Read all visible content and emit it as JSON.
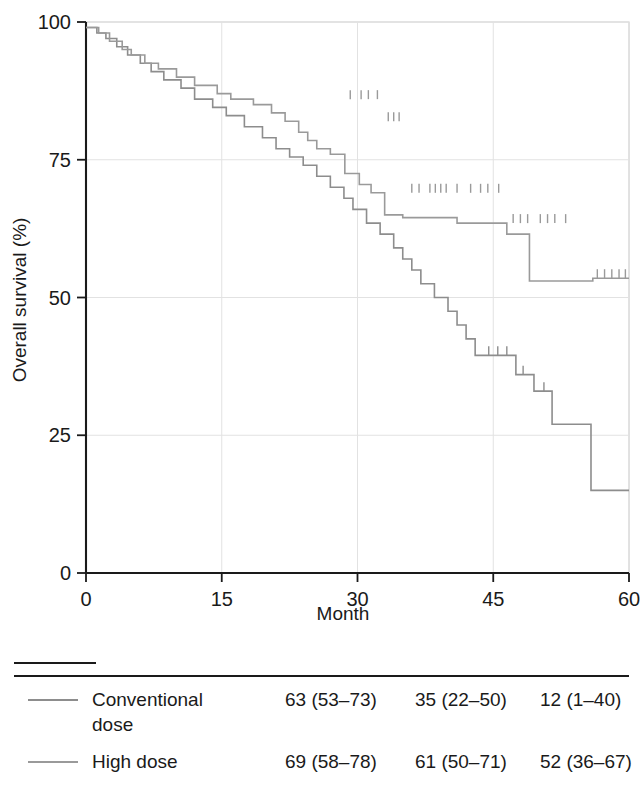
{
  "figure": {
    "type": "kaplan-meier-survival-plot"
  },
  "axes": {
    "y_title": "Overall survival (%)",
    "x_title": "Month",
    "y_ticks": [
      "0",
      "25",
      "50",
      "75",
      "100"
    ],
    "x_ticks": [
      "0",
      "15",
      "30",
      "45",
      "60"
    ]
  },
  "key": {
    "heading": "KEY",
    "rows": [
      {
        "label_line1": "Conventional",
        "label_line2": "dose",
        "col1": "63 (53–73)",
        "col2": "35 (22–50)",
        "col3": "12 (1–40)",
        "color": "#8d8d8d"
      },
      {
        "label_line1": "High dose",
        "label_line2": "",
        "col1": "69 (58–78)",
        "col2": "61 (50–71)",
        "col3": "52 (36–67)",
        "color": "#9a9a9a"
      }
    ]
  },
  "chart_data": {
    "type": "line",
    "title": "",
    "xlabel": "Month",
    "ylabel": "Overall survival (%)",
    "xlim": [
      0,
      60
    ],
    "ylim": [
      0,
      100
    ],
    "xticks": [
      0,
      15,
      30,
      45,
      60
    ],
    "yticks": [
      0,
      25,
      50,
      75,
      100
    ],
    "grid": true,
    "legend_position": "below-plot",
    "step_type": "post",
    "series": [
      {
        "name": "Conventional dose",
        "color": "#8d8d8d",
        "survival_at_12_months": 63,
        "survival_at_36_months": 35,
        "survival_at_60_months": 12,
        "points": [
          [
            0,
            99
          ],
          [
            1.2,
            99
          ],
          [
            1.2,
            98
          ],
          [
            2.2,
            98
          ],
          [
            2.2,
            97
          ],
          [
            3.4,
            97
          ],
          [
            3.4,
            95.5
          ],
          [
            4.6,
            95.5
          ],
          [
            4.6,
            94
          ],
          [
            6.0,
            94
          ],
          [
            6.0,
            92.5
          ],
          [
            7.2,
            92.5
          ],
          [
            7.2,
            91
          ],
          [
            8.6,
            91
          ],
          [
            8.6,
            89.5
          ],
          [
            10.5,
            89.5
          ],
          [
            10.5,
            88
          ],
          [
            12.0,
            88
          ],
          [
            12.0,
            86
          ],
          [
            14.0,
            86
          ],
          [
            14.0,
            84.5
          ],
          [
            15.5,
            84.5
          ],
          [
            15.5,
            83
          ],
          [
            17.5,
            83
          ],
          [
            17.5,
            81
          ],
          [
            19.5,
            81
          ],
          [
            19.5,
            79
          ],
          [
            21.0,
            79
          ],
          [
            21.0,
            77
          ],
          [
            22.5,
            77
          ],
          [
            22.5,
            75.5
          ],
          [
            24.0,
            75.5
          ],
          [
            24.0,
            74
          ],
          [
            25.5,
            74
          ],
          [
            25.5,
            72
          ],
          [
            27.0,
            72
          ],
          [
            27.0,
            70
          ],
          [
            28.5,
            70
          ],
          [
            28.5,
            68
          ],
          [
            29.5,
            68
          ],
          [
            29.5,
            66
          ],
          [
            31.0,
            66
          ],
          [
            31.0,
            63.5
          ],
          [
            32.5,
            63.5
          ],
          [
            32.5,
            61.5
          ],
          [
            34.0,
            61.5
          ],
          [
            34.0,
            59
          ],
          [
            35.0,
            59
          ],
          [
            35.0,
            57
          ],
          [
            36.0,
            57
          ],
          [
            36.0,
            55
          ],
          [
            37.0,
            55
          ],
          [
            37.0,
            52.5
          ],
          [
            38.5,
            52.5
          ],
          [
            38.5,
            50
          ],
          [
            40.0,
            50
          ],
          [
            40.0,
            47.5
          ],
          [
            41.0,
            47.5
          ],
          [
            41.0,
            45
          ],
          [
            42.0,
            45
          ],
          [
            42.0,
            42.5
          ],
          [
            43.0,
            42.5
          ],
          [
            43.0,
            39.5
          ],
          [
            47.5,
            39.5
          ],
          [
            47.5,
            36
          ],
          [
            49.5,
            36
          ],
          [
            49.5,
            33
          ],
          [
            51.5,
            33
          ],
          [
            51.5,
            27
          ],
          [
            55.8,
            27
          ],
          [
            55.8,
            15
          ],
          [
            60,
            15
          ]
        ],
        "censor_marks": [
          [
            44.5,
            39.5
          ],
          [
            45.5,
            39.5
          ],
          [
            46.5,
            39.5
          ],
          [
            48.3,
            36
          ],
          [
            50.6,
            33
          ]
        ]
      },
      {
        "name": "High dose",
        "color": "#9a9a9a",
        "survival_at_12_months": 69,
        "survival_at_36_months": 61,
        "survival_at_60_months": 52,
        "points": [
          [
            0,
            99
          ],
          [
            1.4,
            99
          ],
          [
            1.4,
            98
          ],
          [
            2.6,
            98
          ],
          [
            2.6,
            96.5
          ],
          [
            4.0,
            96.5
          ],
          [
            4.0,
            95
          ],
          [
            5.0,
            95
          ],
          [
            5.0,
            94
          ],
          [
            6.5,
            94
          ],
          [
            6.5,
            92.5
          ],
          [
            8.0,
            92.5
          ],
          [
            8.0,
            91.5
          ],
          [
            10.0,
            91.5
          ],
          [
            10.0,
            90
          ],
          [
            12.0,
            90
          ],
          [
            12.0,
            88.5
          ],
          [
            14.5,
            88.5
          ],
          [
            14.5,
            87
          ],
          [
            16.0,
            87
          ],
          [
            16.0,
            86
          ],
          [
            18.5,
            86
          ],
          [
            18.5,
            85
          ],
          [
            20.5,
            85
          ],
          [
            20.5,
            83.5
          ],
          [
            22.0,
            83.5
          ],
          [
            22.0,
            82
          ],
          [
            23.5,
            82
          ],
          [
            23.5,
            80
          ],
          [
            24.5,
            80
          ],
          [
            24.5,
            78.5
          ],
          [
            25.5,
            78.5
          ],
          [
            25.5,
            77
          ],
          [
            27.0,
            77
          ],
          [
            27.0,
            76
          ],
          [
            28.6,
            76
          ],
          [
            28.6,
            72.5
          ],
          [
            30.2,
            72.5
          ],
          [
            30.2,
            70.5
          ],
          [
            31.5,
            70.5
          ],
          [
            31.5,
            69
          ],
          [
            33.0,
            69
          ],
          [
            33.0,
            65
          ],
          [
            35.0,
            65
          ],
          [
            35.0,
            64.5
          ],
          [
            41.0,
            64.5
          ],
          [
            41.0,
            63.5
          ],
          [
            46.5,
            63.5
          ],
          [
            46.5,
            61.5
          ],
          [
            49.0,
            61.5
          ],
          [
            49.0,
            53
          ],
          [
            56.0,
            53
          ],
          [
            56.0,
            53.5
          ],
          [
            60,
            53.5
          ]
        ],
        "censor_marks": [
          [
            29.2,
            86
          ],
          [
            30.4,
            86
          ],
          [
            31.2,
            86
          ],
          [
            32.2,
            86
          ],
          [
            33.4,
            82
          ],
          [
            34.0,
            82
          ],
          [
            34.6,
            82
          ],
          [
            36.0,
            69
          ],
          [
            36.8,
            69
          ],
          [
            38.0,
            69
          ],
          [
            38.6,
            69
          ],
          [
            39.2,
            69
          ],
          [
            39.8,
            69
          ],
          [
            41.0,
            69
          ],
          [
            42.5,
            69
          ],
          [
            43.6,
            69
          ],
          [
            44.4,
            69
          ],
          [
            45.6,
            69
          ],
          [
            47.2,
            63.5
          ],
          [
            48.0,
            63.5
          ],
          [
            48.8,
            63.5
          ],
          [
            50.2,
            63.5
          ],
          [
            51.0,
            63.5
          ],
          [
            51.8,
            63.5
          ],
          [
            53.0,
            63.5
          ],
          [
            56.5,
            53.5
          ],
          [
            57.3,
            53.5
          ],
          [
            58.1,
            53.5
          ],
          [
            58.9,
            53.5
          ],
          [
            59.6,
            53.5
          ]
        ]
      }
    ]
  }
}
